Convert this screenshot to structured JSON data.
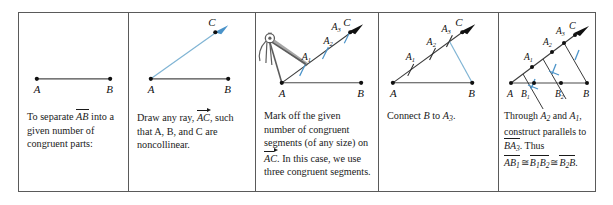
{
  "figure": {
    "colors": {
      "ink": "#1a1a1a",
      "border": "#5a5a5a",
      "construction_blue": "#7fb4d4",
      "tick_blue": "#4a93c9",
      "compass_gray": "#6b6b6b",
      "background": "#ffffff"
    },
    "panel_count": 5
  },
  "panels": [
    {
      "id": "panel-1",
      "step": 1,
      "caption_parts": {
        "lead": "To separate",
        "segment": "AB",
        "rest": "into a given number of congruent parts:"
      },
      "caption_plain": "To separate AB into a given number of congruent parts:",
      "points": [
        "A",
        "B"
      ],
      "labels": {
        "a": "A",
        "b": "B"
      }
    },
    {
      "id": "panel-2",
      "step": 2,
      "caption_parts": {
        "lead": "Draw any ray,",
        "ray": "AC",
        "rest": ", such that A, B, and C are noncollinear."
      },
      "caption_plain": "Draw any ray, AC, such that A, B, and C are noncollinear.",
      "points": [
        "A",
        "B",
        "C"
      ],
      "labels": {
        "a": "A",
        "b": "B",
        "c": "C"
      }
    },
    {
      "id": "panel-3",
      "step": 3,
      "caption_parts": {
        "lead": "Mark off the given number of congruent segments (of any size) on",
        "ray": "AC",
        "rest": ". In this case, we use three congruent segments."
      },
      "caption_plain": "Mark off the given number of congruent segments (of any size) on AC. In this case, we use three congruent segments.",
      "points": [
        "A",
        "B",
        "C"
      ],
      "labels": {
        "a": "A",
        "b": "B",
        "c": "C",
        "a1": "A",
        "a1sub": "1",
        "a2": "A",
        "a2sub": "2",
        "a3": "A",
        "a3sub": "3"
      },
      "tool": "compass-divider"
    },
    {
      "id": "panel-4",
      "step": 4,
      "caption_parts": {
        "lead": "Connect",
        "from": "B",
        "mid": "to",
        "to": "A",
        "tosub": "3",
        "rest": "."
      },
      "caption_plain": "Connect B to A3.",
      "points": [
        "A",
        "B",
        "C"
      ],
      "labels": {
        "a": "A",
        "b": "B",
        "c": "C",
        "a1": "A",
        "a1sub": "1",
        "a2": "A",
        "a2sub": "2",
        "a3": "A",
        "a3sub": "3"
      }
    },
    {
      "id": "panel-5",
      "step": 5,
      "caption_parts": {
        "l1a": "Through",
        "l1b": "A",
        "l1bsub": "2",
        "l1c": "and",
        "l1d": "A",
        "l1dsub": "1",
        "l1e": ",",
        "l2": "construct parallels to",
        "l3a": "BA",
        "l3asub": "3",
        "l3b": ". Thus",
        "r1": "AB",
        "r1sub": "1",
        "cong1": "≅",
        "r2": "B",
        "r2sub": "1",
        "r2b": "B",
        "r2bsub": "2",
        "cong2": "≅",
        "r3": "B",
        "r3sub": "2",
        "r3b": "B",
        "period": "."
      },
      "caption_plain": "Through A2 and A1, construct parallels to BA3. Thus AB1 ≅ B1B2 ≅ B2B.",
      "points": [
        "A",
        "B",
        "C"
      ],
      "labels": {
        "a": "A",
        "b": "B",
        "c": "C",
        "a1": "A",
        "a1sub": "1",
        "a2": "A",
        "a2sub": "2",
        "a3": "A",
        "a3sub": "3",
        "b1": "B",
        "b1sub": "1",
        "b2": "B",
        "b2sub": "2"
      }
    }
  ]
}
